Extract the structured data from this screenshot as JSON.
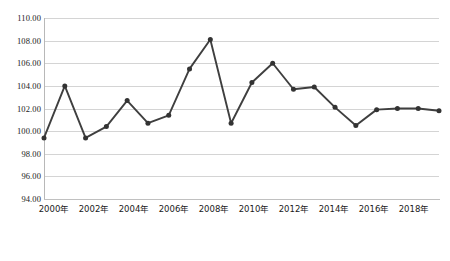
{
  "chart_data": {
    "type": "line",
    "title": "",
    "subtitle": "",
    "xlabel": "",
    "ylabel": "",
    "grid": true,
    "legend_position": "none",
    "ylim": [
      94.0,
      110.0
    ],
    "ytick_step": 2.0,
    "ytick_labels": [
      "110.00",
      "108.00",
      "106.00",
      "104.00",
      "102.00",
      "100.00",
      "98.00",
      "96.00",
      "94.00"
    ],
    "ytick_values": [
      110.0,
      108.0,
      106.0,
      104.0,
      102.0,
      100.0,
      98.0,
      96.0,
      94.0
    ],
    "xtick_labels": [
      "2000年",
      "2002年",
      "2004年",
      "2006年",
      "2008年",
      "2010年",
      "2012年",
      "2014年",
      "2016年",
      "2018年"
    ],
    "xtick_values": [
      2000,
      2002,
      2004,
      2006,
      2008,
      2010,
      2012,
      2014,
      2016,
      2018
    ],
    "x": [
      2000,
      2001,
      2002,
      2003,
      2004,
      2005,
      2006,
      2007,
      2008,
      2009,
      2010,
      2011,
      2012,
      2013,
      2014,
      2015,
      2016,
      2017,
      2018,
      2019
    ],
    "categories": [
      "2000年",
      "2001年",
      "2002年",
      "2003年",
      "2004年",
      "2005年",
      "2006年",
      "2007年",
      "2008年",
      "2009年",
      "2010年",
      "2011年",
      "2012年",
      "2013年",
      "2014年",
      "2015年",
      "2016年",
      "2017年",
      "2018年",
      "2019年"
    ],
    "series": [
      {
        "name": "",
        "values": [
          99.4,
          104.0,
          99.4,
          100.4,
          102.7,
          100.7,
          101.4,
          105.5,
          108.1,
          100.7,
          104.3,
          106.0,
          103.7,
          103.9,
          102.1,
          100.5,
          101.9,
          102.0,
          102.0,
          101.8
        ]
      }
    ],
    "line_color": "#3f3f3f",
    "marker_color": "#333333",
    "grid_color": "#d4d4d4",
    "axis_color": "#b8b8b8"
  }
}
